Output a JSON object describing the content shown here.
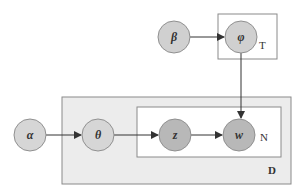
{
  "diagram": {
    "type": "plate-notation-graphical-model",
    "colors": {
      "background": "#ffffff",
      "plate_D_fill": "#ececec",
      "plate_border": "#8a8a8a",
      "plate_inner_fill": "#ffffff",
      "node_fill_light": "#d4d4d4",
      "node_fill_dark": "#b8b8b8",
      "node_stroke": "#909090",
      "edge": "#333333"
    },
    "nodes": [
      {
        "id": "alpha",
        "label": "α",
        "cx": 30,
        "cy": 135
      },
      {
        "id": "theta",
        "label": "θ",
        "cx": 98,
        "cy": 135
      },
      {
        "id": "z",
        "label": "z",
        "cx": 175,
        "cy": 135
      },
      {
        "id": "w",
        "label": "w",
        "cx": 239,
        "cy": 135
      },
      {
        "id": "beta",
        "label": "β",
        "cx": 174,
        "cy": 37
      },
      {
        "id": "phi",
        "label": "φ",
        "cx": 241,
        "cy": 37
      }
    ],
    "plates": [
      {
        "id": "T",
        "label": "T"
      },
      {
        "id": "D",
        "label": "D"
      },
      {
        "id": "N",
        "label": "N"
      }
    ],
    "edges": [
      {
        "from": "beta",
        "to": "phi"
      },
      {
        "from": "alpha",
        "to": "theta"
      },
      {
        "from": "theta",
        "to": "z"
      },
      {
        "from": "z",
        "to": "w"
      },
      {
        "from": "phi",
        "to": "w"
      }
    ]
  }
}
